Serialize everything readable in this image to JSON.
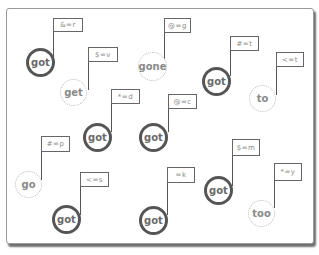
{
  "colors": {
    "card_border": "#9a9a9a",
    "card_shadow": "#6e6e6e",
    "bold_circle": "#555555",
    "dotted_circle": "#bdbdbd",
    "text": "#6a6a6a"
  },
  "nodes": [
    {
      "word": "got",
      "style": "bold",
      "flag": "&=r"
    },
    {
      "word": "get",
      "style": "dotted",
      "flag": "$=v"
    },
    {
      "word": "gone",
      "style": "dotted",
      "flag": "@=g"
    },
    {
      "word": "got",
      "style": "bold",
      "flag": "#=t"
    },
    {
      "word": "to",
      "style": "dotted",
      "flag": "<=t"
    },
    {
      "word": "got",
      "style": "bold",
      "flag": "*=d"
    },
    {
      "word": "got",
      "style": "bold",
      "flag": "@=c"
    },
    {
      "word": "go",
      "style": "dotted",
      "flag": "#=p"
    },
    {
      "word": "got",
      "style": "bold",
      "flag": "<=s"
    },
    {
      "word": "got",
      "style": "bold",
      "flag": "=k"
    },
    {
      "word": "got",
      "style": "bold",
      "flag": "$=m"
    },
    {
      "word": "too",
      "style": "dotted",
      "flag": "*=y"
    }
  ]
}
